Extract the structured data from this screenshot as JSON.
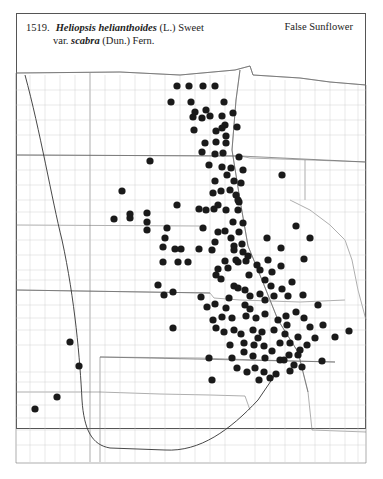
{
  "header": {
    "number": "1519.",
    "genus_species": "Heliopsis helianthoides",
    "author1": "(L.) Sweet",
    "var_label": "var.",
    "variety": "scabra",
    "author2": "(Dun.) Fern.",
    "common_name": "False Sunflower"
  },
  "map": {
    "region": "Great Plains",
    "marker": "filled-dot",
    "marker_color": "#1a1a1a",
    "points": [
      [
        177,
        86
      ],
      [
        189,
        86
      ],
      [
        203,
        86
      ],
      [
        215,
        86
      ],
      [
        171,
        102
      ],
      [
        191,
        102
      ],
      [
        224,
        102
      ],
      [
        195,
        112
      ],
      [
        206,
        110
      ],
      [
        193,
        117
      ],
      [
        202,
        118
      ],
      [
        210,
        116
      ],
      [
        222,
        116
      ],
      [
        233,
        113
      ],
      [
        225,
        125
      ],
      [
        237,
        127
      ],
      [
        194,
        130
      ],
      [
        216,
        131
      ],
      [
        222,
        128
      ],
      [
        226,
        136
      ],
      [
        205,
        143
      ],
      [
        216,
        142
      ],
      [
        226,
        143
      ],
      [
        202,
        152
      ],
      [
        215,
        154
      ],
      [
        223,
        153
      ],
      [
        239,
        157
      ],
      [
        209,
        165
      ],
      [
        222,
        167
      ],
      [
        231,
        168
      ],
      [
        243,
        170
      ],
      [
        241,
        183
      ],
      [
        227,
        175
      ],
      [
        234,
        181
      ],
      [
        215,
        181
      ],
      [
        221,
        191
      ],
      [
        230,
        190
      ],
      [
        236,
        195
      ],
      [
        239,
        202
      ],
      [
        199,
        209
      ],
      [
        206,
        210
      ],
      [
        214,
        209
      ],
      [
        226,
        210
      ],
      [
        238,
        210
      ],
      [
        150,
        161
      ],
      [
        122,
        191
      ],
      [
        130,
        218
      ],
      [
        147,
        213
      ],
      [
        147,
        222
      ],
      [
        177,
        205
      ],
      [
        233,
        222
      ],
      [
        243,
        223
      ],
      [
        203,
        228
      ],
      [
        225,
        231
      ],
      [
        218,
        232
      ],
      [
        231,
        238
      ],
      [
        239,
        232
      ],
      [
        215,
        242
      ],
      [
        242,
        244
      ],
      [
        165,
        238
      ],
      [
        163,
        247
      ],
      [
        167,
        228
      ],
      [
        175,
        249
      ],
      [
        181,
        249
      ],
      [
        234,
        246
      ],
      [
        234,
        250
      ],
      [
        243,
        252
      ],
      [
        163,
        262
      ],
      [
        178,
        262
      ],
      [
        188,
        262
      ],
      [
        225,
        261
      ],
      [
        236,
        260
      ],
      [
        246,
        261
      ],
      [
        216,
        275
      ],
      [
        282,
        175
      ],
      [
        296,
        226
      ],
      [
        267,
        238
      ],
      [
        281,
        248
      ],
      [
        310,
        238
      ],
      [
        268,
        260
      ],
      [
        281,
        266
      ],
      [
        304,
        259
      ],
      [
        158,
        285
      ],
      [
        164,
        295
      ],
      [
        173,
        292
      ],
      [
        218,
        269
      ],
      [
        221,
        279
      ],
      [
        234,
        286
      ],
      [
        229,
        298
      ],
      [
        226,
        308
      ],
      [
        238,
        288
      ],
      [
        245,
        290
      ],
      [
        250,
        296
      ],
      [
        245,
        305
      ],
      [
        260,
        294
      ],
      [
        265,
        300
      ],
      [
        274,
        296
      ],
      [
        282,
        289
      ],
      [
        288,
        296
      ],
      [
        271,
        286
      ],
      [
        201,
        297
      ],
      [
        207,
        307
      ],
      [
        215,
        304
      ],
      [
        222,
        317
      ],
      [
        232,
        318
      ],
      [
        246,
        316
      ],
      [
        256,
        318
      ],
      [
        265,
        314
      ],
      [
        213,
        320
      ],
      [
        224,
        332
      ],
      [
        234,
        330
      ],
      [
        241,
        334
      ],
      [
        253,
        330
      ],
      [
        262,
        332
      ],
      [
        274,
        330
      ],
      [
        285,
        334
      ],
      [
        244,
        343
      ],
      [
        254,
        345
      ],
      [
        264,
        346
      ],
      [
        280,
        343
      ],
      [
        290,
        343
      ],
      [
        300,
        350
      ],
      [
        307,
        345
      ],
      [
        230,
        345
      ],
      [
        244,
        352
      ],
      [
        253,
        356
      ],
      [
        265,
        358
      ],
      [
        280,
        360
      ],
      [
        289,
        355
      ],
      [
        298,
        355
      ],
      [
        255,
        368
      ],
      [
        264,
        372
      ],
      [
        276,
        374
      ],
      [
        290,
        371
      ],
      [
        302,
        367
      ],
      [
        322,
        361
      ],
      [
        315,
        338
      ],
      [
        298,
        337
      ],
      [
        286,
        316
      ],
      [
        296,
        312
      ],
      [
        304,
        318
      ],
      [
        310,
        327
      ],
      [
        323,
        325
      ],
      [
        335,
        337
      ],
      [
        318,
        305
      ],
      [
        349,
        331
      ],
      [
        216,
        328
      ],
      [
        258,
        338
      ],
      [
        237,
        368
      ],
      [
        247,
        372
      ],
      [
        272,
        351
      ],
      [
        147,
        230
      ],
      [
        114,
        219
      ],
      [
        130,
        214
      ],
      [
        173,
        328
      ],
      [
        212,
        380
      ],
      [
        70,
        342
      ],
      [
        79,
        366
      ],
      [
        57,
        397
      ],
      [
        35,
        409
      ],
      [
        248,
        256
      ],
      [
        218,
        205
      ],
      [
        238,
        200
      ],
      [
        213,
        193
      ],
      [
        257,
        265
      ],
      [
        272,
        272
      ],
      [
        238,
        262
      ],
      [
        260,
        270
      ],
      [
        265,
        280
      ],
      [
        209,
        358
      ],
      [
        270,
        378
      ],
      [
        259,
        380
      ],
      [
        232,
        358
      ],
      [
        250,
        309
      ],
      [
        284,
        360
      ],
      [
        294,
        365
      ],
      [
        278,
        320
      ],
      [
        287,
        325
      ],
      [
        303,
        295
      ],
      [
        292,
        282
      ],
      [
        249,
        275
      ],
      [
        228,
        268
      ],
      [
        212,
        250
      ],
      [
        199,
        249
      ]
    ]
  }
}
